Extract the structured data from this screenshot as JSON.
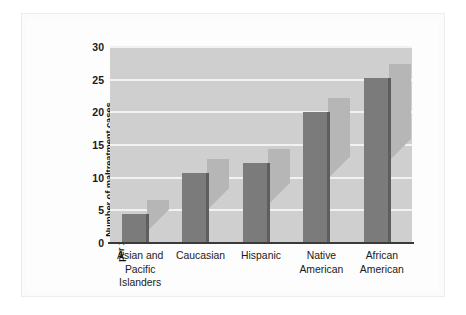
{
  "chart_data": {
    "type": "bar",
    "title": "",
    "subtitle": "",
    "xlabel": "",
    "ylabel": "Number of maltreatment cases per 1,000 children in racial or ethnic group",
    "ylabel_line1": "Number of maltreatment cases",
    "ylabel_line2": "per 1,000 children in racial or ethnic group",
    "categories": [
      "Asian and Pacific Islanders",
      "Caucasian",
      "Hispanic",
      "Native American",
      "African American"
    ],
    "category_lines": [
      [
        "Asian and",
        "Pacific",
        "Islanders"
      ],
      [
        "Caucasian"
      ],
      [
        "Hispanic"
      ],
      [
        "Native",
        "American"
      ],
      [
        "African",
        "American"
      ]
    ],
    "values": [
      4.5,
      10.7,
      12.3,
      20.1,
      25.3
    ],
    "ylim": [
      0,
      30
    ],
    "yticks": [
      0,
      5,
      10,
      15,
      20,
      25,
      30
    ],
    "ytick_labels": [
      "0",
      "5",
      "10",
      "15",
      "20",
      "25",
      "30"
    ],
    "grid": true,
    "grid_axis": "y",
    "legend": false,
    "legend_position": "none",
    "colors": {
      "bar_fill": "#7b7b7b",
      "bar_edge": "#5e5e5e",
      "bar_shadow": "#b6b6b6",
      "plot_background": "#cfcfcf",
      "gridline": "#f2f2f2",
      "axis": "#3a3a3a",
      "text": "#1a1a1a",
      "figure_background": "#fdfdfd",
      "frame": "#ededed"
    }
  }
}
